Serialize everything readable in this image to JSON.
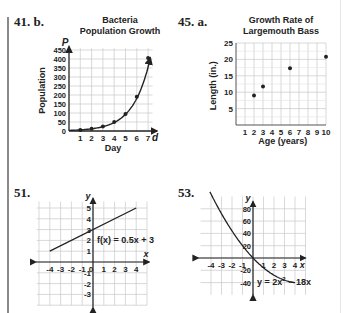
{
  "problems": [
    {
      "label": "41. b."
    },
    {
      "label": "45. a."
    },
    {
      "label": "51."
    },
    {
      "label": "53."
    }
  ],
  "chart_data": [
    {
      "id": "41b",
      "type": "scatter",
      "title": "Bacteria Population Growth",
      "title_lines": [
        "Bacteria",
        "Population Growth"
      ],
      "xlabel": "Day",
      "ylabel": "Population",
      "x_axis_var": "d",
      "y_axis_var": "P",
      "x": [
        1,
        2,
        3,
        4,
        5,
        6,
        7
      ],
      "values": [
        6,
        12,
        25,
        50,
        95,
        190,
        405
      ],
      "x_ticks": [
        "1",
        "2",
        "3",
        "4",
        "5",
        "6",
        "7"
      ],
      "y_ticks": [
        "0",
        "50",
        "100",
        "150",
        "200",
        "250",
        "300",
        "350",
        "400",
        "450"
      ],
      "xlim": [
        0,
        7.5
      ],
      "ylim": [
        0,
        460
      ],
      "grid": true,
      "curve": "exponential fit through points with arrow"
    },
    {
      "id": "45a",
      "type": "scatter",
      "title": "Growth Rate of Largemouth Bass",
      "title_lines": [
        "Growth Rate of",
        "Largemouth Bass"
      ],
      "xlabel": "Age (years)",
      "ylabel": "Length (in.)",
      "x": [
        2,
        3,
        6,
        10
      ],
      "values": [
        9,
        11.7,
        17.3,
        20.8
      ],
      "x_ticks": [
        "1",
        "2",
        "3",
        "4",
        "5",
        "6",
        "7",
        "8",
        "9",
        "10"
      ],
      "y_ticks": [
        "5",
        "10",
        "15",
        "20",
        "25"
      ],
      "xlim": [
        0,
        10
      ],
      "ylim": [
        0,
        25
      ],
      "grid": true
    },
    {
      "id": "51",
      "type": "line",
      "title": "",
      "equation": "f(x) = 0.5x + 3",
      "xlabel": "x",
      "ylabel": "y",
      "x": [
        -4,
        4
      ],
      "values": [
        1,
        5
      ],
      "x_ticks": [
        "-4",
        "-3",
        "-2",
        "-1",
        "0",
        "1",
        "2",
        "3",
        "4"
      ],
      "y_ticks": [
        "-3",
        "-2",
        "-1",
        "1",
        "2",
        "3",
        "4",
        "5"
      ],
      "xlim": [
        -5,
        5
      ],
      "ylim": [
        -4,
        6
      ],
      "grid": true
    },
    {
      "id": "53",
      "type": "line",
      "title": "",
      "equation": "y = 2x² − 18x",
      "equation_parts": {
        "pre": "y = 2x",
        "sup": "2",
        "post": " − 18x"
      },
      "xlabel": "x",
      "ylabel": "y",
      "x": [
        -4,
        -3,
        -2,
        -1,
        0,
        1,
        2,
        3,
        4
      ],
      "values": [
        104,
        72,
        44,
        20,
        0,
        -16,
        -28,
        -36,
        -40
      ],
      "x_ticks": [
        "-4",
        "-3",
        "-2",
        "-1",
        "1",
        "2",
        "3",
        "4"
      ],
      "y_ticks": [
        "-40",
        "-20",
        "20",
        "40",
        "60",
        "80"
      ],
      "xlim": [
        -4.5,
        4.5
      ],
      "ylim": [
        -50,
        100
      ],
      "grid": true
    }
  ]
}
